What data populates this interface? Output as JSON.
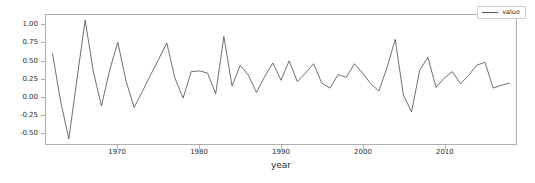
{
  "chart_data": {
    "type": "line",
    "title": "",
    "xlabel": "year",
    "ylabel": "",
    "xlim": [
      1961.2,
      2018.8
    ],
    "ylim": [
      -0.66,
      1.14
    ],
    "grid": false,
    "legend": {
      "position": "upper-right",
      "entries": [
        "value"
      ]
    },
    "xticks": [
      1970,
      1980,
      1990,
      2000,
      2010
    ],
    "xtick_labels": [
      "1970",
      "1980",
      "1990",
      "2000",
      "2010"
    ],
    "yticks": [
      1.0,
      0.75,
      0.5,
      0.25,
      0.0,
      -0.25,
      -0.5
    ],
    "ytick_labels": [
      "1.00",
      "0.75",
      "0.50",
      "0.25",
      "0.00",
      "-0.25",
      "-0.50"
    ],
    "line_color": "#4a4a4a",
    "series": [
      {
        "name": "value",
        "x": [
          1962,
          1963,
          1964,
          1965,
          1966,
          1967,
          1968,
          1969,
          1970,
          1971,
          1972,
          1973,
          1974,
          1975,
          1976,
          1977,
          1978,
          1979,
          1980,
          1981,
          1982,
          1983,
          1984,
          1985,
          1986,
          1987,
          1988,
          1989,
          1990,
          1991,
          1992,
          1993,
          1994,
          1995,
          1996,
          1997,
          1998,
          1999,
          2000,
          2001,
          2002,
          2003,
          2004,
          2005,
          2006,
          2007,
          2008,
          2009,
          2010,
          2011,
          2012,
          2013,
          2014,
          2015,
          2016,
          2017,
          2018
        ],
        "values": [
          0.6,
          -0.07,
          -0.59,
          0.25,
          1.07,
          0.35,
          -0.13,
          0.37,
          0.76,
          0.22,
          -0.15,
          0.07,
          0.3,
          0.52,
          0.75,
          0.26,
          -0.02,
          0.35,
          0.36,
          0.33,
          0.04,
          0.84,
          0.15,
          0.44,
          0.3,
          0.06,
          0.28,
          0.47,
          0.23,
          0.5,
          0.21,
          0.33,
          0.46,
          0.19,
          0.12,
          0.31,
          0.27,
          0.46,
          0.33,
          0.18,
          0.08,
          0.41,
          0.8,
          0.02,
          -0.21,
          0.37,
          0.55,
          0.13,
          0.26,
          0.35,
          0.18,
          0.3,
          0.44,
          0.48,
          0.12,
          0.16,
          0.19
        ]
      }
    ]
  },
  "legend": {
    "label": "value"
  },
  "axis": {
    "x_title": "year"
  }
}
